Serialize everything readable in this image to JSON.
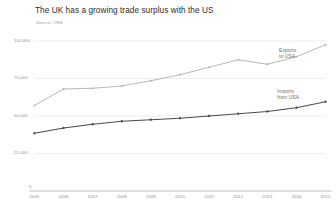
{
  "title": "The UK has a growing trade surplus with the US",
  "source": "Source: ONS",
  "labels": {
    "exports_line1": "Exports",
    "exports_line2": "to USA",
    "imports_line1": "Imports",
    "imports_line2": "from USA",
    "zero": "0"
  },
  "colors": {
    "exports": "#b0b0b0",
    "imports": "#4a4a4a",
    "grid": "#e6e6e6",
    "axis": "#b9b9b9",
    "text": "#8d8d8d",
    "title": "#2b2b2b"
  },
  "chart_data": {
    "type": "line",
    "title": "The UK has a growing trade surplus with the US",
    "subtitle": "Source: ONS",
    "xlabel": "",
    "ylabel": "",
    "x": [
      "2005",
      "2006",
      "2007",
      "2008",
      "2009",
      "2010",
      "2011",
      "2012",
      "2013",
      "2014",
      "2015"
    ],
    "categories": [
      "2005",
      "2006",
      "2007",
      "2008",
      "2009",
      "2010",
      "2011",
      "2012",
      "2013",
      "2014",
      "2015"
    ],
    "ylim": [
      0,
      100000
    ],
    "yticks": [
      25000,
      50000,
      75000,
      100000
    ],
    "ytick_labels": [
      "25,000",
      "50,000",
      "75,000",
      "100,000"
    ],
    "grid": true,
    "legend": "inline-annotation",
    "series": [
      {
        "name": "Exports to USA",
        "color": "#b0b0b0",
        "values": [
          57000,
          68000,
          68500,
          70000,
          73500,
          77500,
          82500,
          87500,
          84500,
          89500,
          97500
        ]
      },
      {
        "name": "Imports from USA",
        "color": "#4a4a4a",
        "values": [
          38500,
          42000,
          44500,
          46500,
          47500,
          48500,
          50000,
          51500,
          53000,
          55500,
          59500
        ]
      }
    ]
  }
}
